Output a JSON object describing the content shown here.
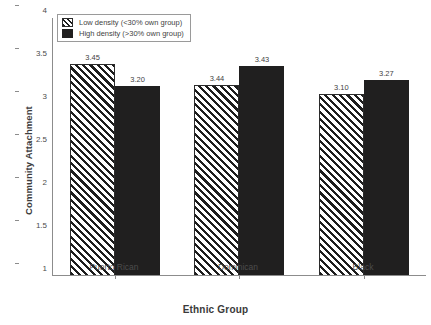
{
  "chart_data": {
    "type": "bar",
    "title": "",
    "xlabel": "Ethnic Group",
    "ylabel": "Community Attachment",
    "categories": [
      "Puerto Rican",
      "Dominican",
      "Black"
    ],
    "series": [
      {
        "name": "Low density (<30% own group)",
        "values": [
          3.45,
          3.20999,
          3.1
        ],
        "labels": [
          "3.45",
          "3.44",
          "3.10"
        ],
        "style": "hatched-diagonal",
        "color": "#ffffff"
      },
      {
        "name": "High density (>30% own group)",
        "values": [
          3.2,
          3.43,
          3.27
        ],
        "labels": [
          "3.20",
          "3.43",
          "3.27"
        ],
        "style": "solid",
        "color": "#201f1f"
      }
    ],
    "ylim": [
      1,
      4
    ],
    "yticks": [
      "1",
      "1.5",
      "2",
      "2.5",
      "3",
      "3.5",
      "4"
    ],
    "ytick_values": [
      1,
      1.5,
      2,
      2.5,
      3,
      3.5,
      4
    ],
    "grid": false,
    "legend_position": "top-left",
    "baseline": 1
  },
  "legend": {
    "entries": [
      {
        "label": "Low density (<30% own group)"
      },
      {
        "label": "High density (>30% own group)"
      }
    ]
  }
}
